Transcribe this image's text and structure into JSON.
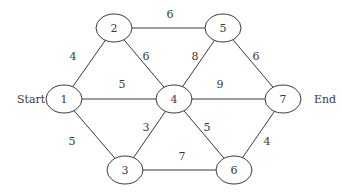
{
  "diagram": {
    "type": "weighted-undirected-graph",
    "colors": {
      "stroke": "#3a3a3a",
      "text": "#3a3a3a",
      "background": "#ffffff"
    },
    "nodes": [
      {
        "id": "1",
        "label": "1",
        "x": 64,
        "y": 99
      },
      {
        "id": "2",
        "label": "2",
        "x": 114,
        "y": 28
      },
      {
        "id": "3",
        "label": "3",
        "x": 125,
        "y": 170
      },
      {
        "id": "4",
        "label": "4",
        "x": 174,
        "y": 99
      },
      {
        "id": "5",
        "label": "5",
        "x": 223,
        "y": 28
      },
      {
        "id": "6",
        "label": "6",
        "x": 234,
        "y": 170
      },
      {
        "id": "7",
        "label": "7",
        "x": 283,
        "y": 99
      }
    ],
    "edges": [
      {
        "from": "1",
        "to": "2",
        "weight": "4",
        "lx": 73,
        "ly": 60
      },
      {
        "from": "2",
        "to": "5",
        "weight": "6",
        "lx": 170,
        "ly": 18
      },
      {
        "from": "2",
        "to": "4",
        "weight": "6",
        "lx": 146,
        "ly": 60
      },
      {
        "from": "4",
        "to": "5",
        "weight": "8",
        "lx": 195,
        "ly": 60
      },
      {
        "from": "5",
        "to": "7",
        "weight": "6",
        "lx": 256,
        "ly": 60
      },
      {
        "from": "1",
        "to": "4",
        "weight": "5",
        "lx": 122,
        "ly": 88
      },
      {
        "from": "4",
        "to": "7",
        "weight": "9",
        "lx": 220,
        "ly": 88
      },
      {
        "from": "1",
        "to": "3",
        "weight": "5",
        "lx": 72,
        "ly": 145
      },
      {
        "from": "3",
        "to": "4",
        "weight": "3",
        "lx": 146,
        "ly": 131
      },
      {
        "from": "4",
        "to": "6",
        "weight": "5",
        "lx": 207,
        "ly": 131
      },
      {
        "from": "6",
        "to": "7",
        "weight": "4",
        "lx": 267,
        "ly": 145
      },
      {
        "from": "3",
        "to": "6",
        "weight": "7",
        "lx": 182,
        "ly": 160
      }
    ],
    "start_label": "Start",
    "end_label": "End"
  }
}
